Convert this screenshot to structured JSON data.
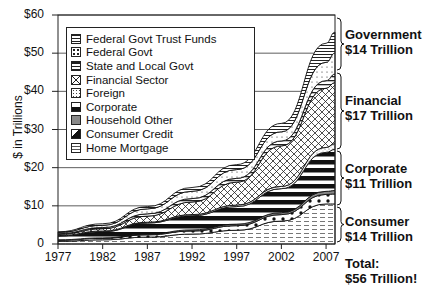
{
  "chart_data": {
    "type": "area",
    "stacked": true,
    "title": "",
    "xlabel": "",
    "ylabel": "$ in Trillions",
    "ylim": [
      0,
      60
    ],
    "xlim": [
      1977,
      2008
    ],
    "yticks": [
      "0",
      "$10",
      "$20",
      "$30",
      "$40",
      "$50",
      "$60"
    ],
    "xticks": [
      "1977",
      "1982",
      "1987",
      "1992",
      "1997",
      "2002",
      "2007"
    ],
    "grid": "horizontal",
    "legend_position": "upper-left inside",
    "x": [
      1977,
      1982,
      1987,
      1992,
      1997,
      2002,
      2007,
      2008
    ],
    "series": [
      {
        "name": "Home Mortgage",
        "group": "Consumer",
        "values": [
          0.7,
          1.1,
          1.8,
          2.6,
          3.6,
          6.0,
          10.5,
          10.5
        ]
      },
      {
        "name": "Consumer Credit",
        "group": "Consumer",
        "values": [
          0.3,
          0.4,
          0.6,
          0.8,
          1.2,
          1.7,
          2.5,
          2.6
        ]
      },
      {
        "name": "Household Other",
        "group": "Consumer",
        "values": [
          0.1,
          0.1,
          0.2,
          0.3,
          0.4,
          0.5,
          0.8,
          0.9
        ]
      },
      {
        "name": "Corporate",
        "group": "Corporate",
        "values": [
          1.0,
          1.6,
          2.9,
          3.7,
          4.6,
          6.3,
          10.2,
          10.8
        ]
      },
      {
        "name": "Foreign",
        "group": "Financial",
        "values": [
          0.1,
          0.2,
          0.2,
          0.3,
          0.4,
          0.6,
          1.3,
          1.5
        ]
      },
      {
        "name": "Financial Sector",
        "group": "Financial",
        "values": [
          0.3,
          0.6,
          1.6,
          3.3,
          6.0,
          10.6,
          15.5,
          16.0
        ]
      },
      {
        "name": "State and Local Govt",
        "group": "Government",
        "values": [
          0.2,
          0.3,
          0.6,
          0.9,
          1.0,
          1.3,
          2.0,
          2.2
        ]
      },
      {
        "name": "Federal Govt",
        "group": "Government",
        "values": [
          0.3,
          0.6,
          1.3,
          1.9,
          2.3,
          2.4,
          4.8,
          5.5
        ]
      },
      {
        "name": "Federal Govt Trust Funds",
        "group": "Government",
        "values": [
          0.2,
          0.4,
          0.6,
          1.0,
          1.3,
          2.2,
          5.0,
          5.5
        ]
      }
    ],
    "annotations": [
      {
        "label": "Government",
        "value": "$14 Trillion"
      },
      {
        "label": "Financial",
        "value": "$17 Trillion"
      },
      {
        "label": "Corporate",
        "value": "$11 Trillion"
      },
      {
        "label": "Consumer",
        "value": "$14 Trillion"
      },
      {
        "label": "Total:",
        "value": "$56 Trillion!"
      }
    ]
  },
  "axis": {
    "ylabel": "$ in Trillions",
    "yticks": [
      "0",
      "$10",
      "$20",
      "$30",
      "$40",
      "$50",
      "$60"
    ],
    "xticks": [
      "1977",
      "1982",
      "1987",
      "1992",
      "1997",
      "2002",
      "2007"
    ]
  },
  "legend": [
    {
      "label": "Federal Govt Trust Funds",
      "pattern": "hstripe"
    },
    {
      "label": "Federal Govt",
      "pattern": "dots"
    },
    {
      "label": "State and Local Govt",
      "pattern": "hstripe-wide"
    },
    {
      "label": "Financial Sector",
      "pattern": "crosshatch"
    },
    {
      "label": "Foreign",
      "pattern": "stipple"
    },
    {
      "label": "Corporate",
      "pattern": "black-bars"
    },
    {
      "label": "Household Other",
      "pattern": "gray"
    },
    {
      "label": "Consumer Credit",
      "pattern": "black-dots"
    },
    {
      "label": "Home Mortgage",
      "pattern": "dashes"
    }
  ],
  "groups": [
    {
      "label": "Government",
      "value": "$14 Trillion"
    },
    {
      "label": "Financial",
      "value": "$17 Trillion"
    },
    {
      "label": "Corporate",
      "value": "$11 Trillion"
    },
    {
      "label": "Consumer",
      "value": "$14 Trillion"
    }
  ],
  "total": {
    "label": "Total:",
    "value": "$56 Trillion!"
  }
}
